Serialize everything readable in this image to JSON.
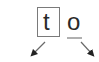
{
  "diagram": {
    "tokens": [
      {
        "text": "t",
        "style": "boxed"
      },
      {
        "text": "o",
        "style": "underlined"
      }
    ],
    "arrows": [
      {
        "direction": "down-left",
        "from": [
          45,
          42
        ],
        "to": [
          31,
          56
        ]
      },
      {
        "direction": "down-right",
        "from": [
          81,
          42
        ],
        "to": [
          94,
          56
        ]
      }
    ],
    "colors": {
      "box_border": "#7a7a7a",
      "text": "#2a2a2a",
      "underline": "#b0b0b0",
      "arrow": "#6a6a6a",
      "arrowhead": "#222222"
    }
  }
}
